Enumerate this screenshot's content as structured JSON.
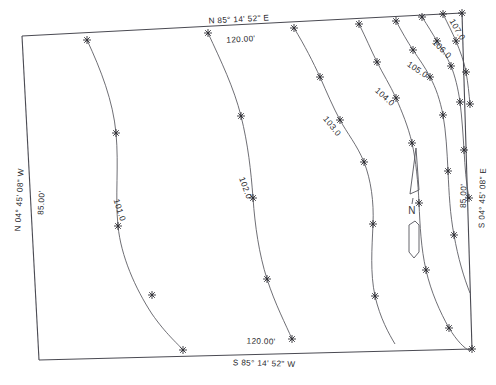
{
  "document": {
    "type": "survey-plat-topographic-map",
    "title": "Boundary Survey with Contours"
  },
  "boundary": {
    "corners": {
      "nw": {
        "x": 22,
        "y": 36
      },
      "ne": {
        "x": 462,
        "y": 13
      },
      "se": {
        "x": 472,
        "y": 349
      },
      "sw": {
        "x": 39,
        "y": 360
      }
    },
    "sides": [
      {
        "name": "north-line",
        "bearing": "N 85° 14' 52\" E",
        "distance": "120.00'",
        "bearing_pos": {
          "x": 239,
          "y": 22
        },
        "distance_pos": {
          "x": 241,
          "y": 42
        },
        "rotation": -3
      },
      {
        "name": "south-line",
        "bearing": "S 85° 14' 52\" W",
        "distance": "120.00'",
        "bearing_pos": {
          "x": 264,
          "y": 366
        },
        "distance_pos": {
          "x": 261,
          "y": 344
        },
        "rotation": 1.6
      },
      {
        "name": "west-line",
        "bearing": "N 04° 45' 08\" W",
        "distance": "85.00'",
        "bearing_pos": {
          "x": 22,
          "y": 200
        },
        "distance_pos": {
          "x": 44,
          "y": 203
        },
        "rotation": -87
      },
      {
        "name": "east-line",
        "bearing": "S 04° 45' 08\" E",
        "distance": "85.00'",
        "bearing_pos": {
          "x": 485,
          "y": 198
        },
        "distance_pos": {
          "x": 466,
          "y": 196
        },
        "rotation": -88.5
      }
    ]
  },
  "contours": [
    {
      "elevation": "101.0",
      "label_pos": {
        "x": 117,
        "y": 211
      },
      "label_rotation": 72,
      "path": "M 87,40 C 101,70 113,101 116,133 C 119,166 115,196 118,226 C 121,256 135,288 152,314 C 166,334 177,343 183,350"
    },
    {
      "elevation": "102.0",
      "label_pos": {
        "x": 243,
        "y": 189
      },
      "label_rotation": 70,
      "path": "M 208,33 C 221,61 234,88 241,116 C 248,144 251,171 253,198 C 255,226 259,254 267,279 C 275,304 286,325 292,339"
    },
    {
      "elevation": "103.0",
      "label_pos": {
        "x": 330,
        "y": 128
      },
      "label_rotation": 51,
      "path": "M 294,28 C 305,46 313,62 320,77 C 327,93 333,107 340,120 C 347,133 357,145 364,162 C 371,180 374,202 373,224 C 372,248 370,273 375,296 C 380,318 389,334 395,344"
    },
    {
      "elevation": "104.0",
      "label_pos": {
        "x": 383,
        "y": 99
      },
      "label_rotation": 42,
      "path": "M 359,24 C 366,38 371,50 377,62 C 383,74 390,85 396,98 C 402,112 408,126 412,143 C 416,161 418,182 419,203 C 420,226 421,248 426,270 C 431,292 440,312 449,328 C 457,341 464,348 470,351"
    },
    {
      "elevation": "105.0",
      "label_pos": {
        "x": 416,
        "y": 72
      },
      "label_rotation": 34,
      "path": "M 396,21 C 402,32 407,41 413,50 C 419,59 425,67 430,77 C 436,88 440,100 443,115 C 446,132 447,151 448,171 C 449,193 450,214 454,235 C 458,258 464,278 470,293"
    },
    {
      "elevation": "106.0",
      "label_pos": {
        "x": 440,
        "y": 51
      },
      "label_rotation": 45,
      "path": "M 422,17 C 428,26 432,33 437,41 C 442,49 447,57 451,66 C 455,76 458,88 460,102 C 462,118 463,134 464,150 C 465,167 466,183 469,198"
    },
    {
      "elevation": "107.0",
      "label_pos": {
        "x": 455,
        "y": 31
      },
      "label_rotation": 60,
      "path": "M 443,14 C 448,24 452,32 456,41 C 460,51 464,61 466,72 C 468,83 469,94 470,104"
    }
  ],
  "shot_points": [
    {
      "x": 87,
      "y": 40
    },
    {
      "x": 116,
      "y": 133
    },
    {
      "x": 118,
      "y": 226
    },
    {
      "x": 152,
      "y": 295
    },
    {
      "x": 183,
      "y": 350
    },
    {
      "x": 208,
      "y": 33
    },
    {
      "x": 241,
      "y": 116
    },
    {
      "x": 253,
      "y": 198
    },
    {
      "x": 267,
      "y": 279
    },
    {
      "x": 292,
      "y": 339
    },
    {
      "x": 294,
      "y": 28
    },
    {
      "x": 320,
      "y": 77
    },
    {
      "x": 340,
      "y": 120
    },
    {
      "x": 364,
      "y": 162
    },
    {
      "x": 373,
      "y": 224
    },
    {
      "x": 375,
      "y": 296
    },
    {
      "x": 359,
      "y": 24
    },
    {
      "x": 377,
      "y": 62
    },
    {
      "x": 396,
      "y": 98
    },
    {
      "x": 412,
      "y": 143
    },
    {
      "x": 419,
      "y": 203
    },
    {
      "x": 426,
      "y": 270
    },
    {
      "x": 449,
      "y": 328
    },
    {
      "x": 396,
      "y": 21
    },
    {
      "x": 413,
      "y": 50
    },
    {
      "x": 430,
      "y": 77
    },
    {
      "x": 443,
      "y": 115
    },
    {
      "x": 448,
      "y": 171
    },
    {
      "x": 454,
      "y": 235
    },
    {
      "x": 422,
      "y": 17
    },
    {
      "x": 437,
      "y": 41
    },
    {
      "x": 451,
      "y": 66
    },
    {
      "x": 460,
      "y": 102
    },
    {
      "x": 464,
      "y": 150
    },
    {
      "x": 469,
      "y": 198
    },
    {
      "x": 443,
      "y": 14
    },
    {
      "x": 456,
      "y": 41
    },
    {
      "x": 466,
      "y": 72
    },
    {
      "x": 470,
      "y": 104
    },
    {
      "x": 462,
      "y": 13
    },
    {
      "x": 472,
      "y": 349
    }
  ],
  "north_arrow": {
    "label": "N",
    "label_pos": {
      "x": 412,
      "y": 206
    },
    "tip": {
      "x": 416,
      "y": 147
    },
    "head_path": "M 416,148 L 410,194 L 419,190 Z",
    "shaft_path": "M 415,221 L 409,224 L 409,252 L 415,258 L 421,252 L 421,224 Z",
    "stem_path": "M 414,194 L 413,199"
  },
  "colors": {
    "boundary_stroke": "#4a4a52",
    "contour_stroke": "#55555c",
    "text": "#27272b",
    "background": "#ffffff"
  }
}
